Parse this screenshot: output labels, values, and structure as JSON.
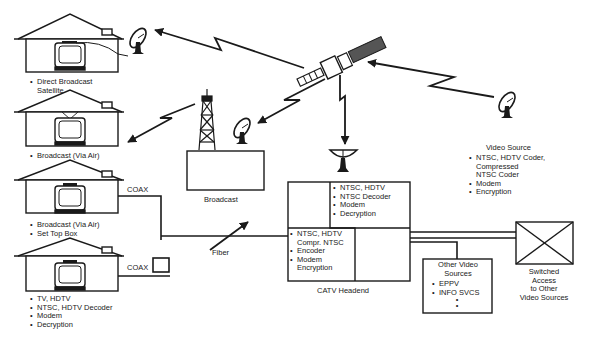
{
  "houses": [
    {
      "id": "house-dbs",
      "bullets": [
        "Direct Broadcast Satellite"
      ]
    },
    {
      "id": "house-air",
      "bullets": [
        "Broadcast (Via Air)"
      ]
    },
    {
      "id": "house-stb",
      "bullets": [
        "Broadcast (Via Air)",
        "Set Top Box"
      ]
    },
    {
      "id": "house-hdtv",
      "bullets": [
        "TV, HDTV",
        "NTSC, HDTV Decoder",
        "Modem",
        "Decryption"
      ]
    }
  ],
  "labels": {
    "coax_1": "COAX",
    "coax_2": "COAX",
    "fiber": "Fiber",
    "broadcast": "Broadcast",
    "catv_headend": "CATV Headend",
    "switched_access": [
      "Switched",
      "Access",
      "to Other",
      "Video Sources"
    ]
  },
  "headend_upper": [
    "NTSC, HDTV",
    "NTSC Decoder",
    "Modem",
    "Decryption"
  ],
  "headend_lower": [
    {
      "text": "NTSC, HDTV",
      "bullet": true
    },
    {
      "text": "Compr. NTSC",
      "bullet": false
    },
    {
      "text": "Encoder",
      "bullet": true
    },
    {
      "text": "Modem",
      "bullet": true
    },
    {
      "text": "Encryption",
      "bullet": false
    }
  ],
  "other_sources": {
    "title": [
      "Other Video",
      "Sources"
    ],
    "items": [
      "EPPV",
      "INFO SVCS"
    ],
    "more": [
      "•",
      "•"
    ]
  },
  "video_source": {
    "title": "Video Source",
    "items": [
      {
        "text": "NTSC, HDTV Coder,",
        "bullet": true
      },
      {
        "text": "Compressed",
        "bullet": false
      },
      {
        "text": "NTSC Coder",
        "bullet": false
      },
      {
        "text": "Modem",
        "bullet": true
      },
      {
        "text": "Encryption",
        "bullet": true
      }
    ]
  },
  "colors": {
    "ink": "#1a1a1a",
    "background": "#ffffff"
  }
}
